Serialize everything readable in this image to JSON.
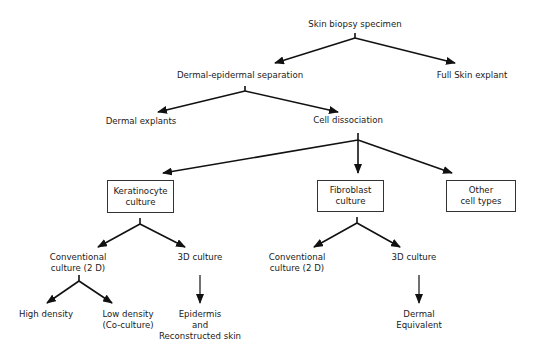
{
  "diagram": {
    "type": "flowchart",
    "nodes": {
      "root": "Skin biopsy specimen",
      "separation": "Dermal-epidermal separation",
      "full_skin": "Full Skin explant",
      "dermal_explants": "Dermal explants",
      "cell_dissociation": "Cell dissociation",
      "keratinocyte": "Keratinocyte\nculture",
      "fibroblast": "Fibroblast\nculture",
      "other": "Other\ncell types",
      "k_conventional_1": "Conventional",
      "k_conventional_2": "culture (2 D)",
      "k_3d": "3D culture",
      "high_density": "High density",
      "low_density_1": "Low density",
      "low_density_2": "(Co-culture)",
      "epidermis_1": "Epidermis",
      "epidermis_2": "and",
      "epidermis_3": "Reconstructed skin",
      "f_conventional_1": "Conventional",
      "f_conventional_2": "culture (2 D)",
      "f_3d": "3D culture",
      "dermal_eq_1": "Dermal",
      "dermal_eq_2": "Equivalent"
    },
    "edges": [
      [
        "Skin biopsy specimen",
        "Dermal-epidermal separation"
      ],
      [
        "Skin biopsy specimen",
        "Full Skin explant"
      ],
      [
        "Dermal-epidermal separation",
        "Dermal explants"
      ],
      [
        "Dermal-epidermal separation",
        "Cell dissociation"
      ],
      [
        "Cell dissociation",
        "Keratinocyte culture"
      ],
      [
        "Cell dissociation",
        "Fibroblast culture"
      ],
      [
        "Cell dissociation",
        "Other cell types"
      ],
      [
        "Keratinocyte culture",
        "Conventional culture (2 D)"
      ],
      [
        "Keratinocyte culture",
        "3D culture"
      ],
      [
        "Conventional culture (2 D)",
        "High density"
      ],
      [
        "Conventional culture (2 D)",
        "Low density (Co-culture)"
      ],
      [
        "3D culture",
        "Epidermis and Reconstructed skin"
      ],
      [
        "Fibroblast culture",
        "Conventional culture (2 D)"
      ],
      [
        "Fibroblast culture",
        "3D culture"
      ],
      [
        "3D culture",
        "Dermal Equivalent"
      ]
    ],
    "colors": {
      "line": "#111111",
      "box_border": "#333333",
      "background": "#ffffff"
    }
  }
}
